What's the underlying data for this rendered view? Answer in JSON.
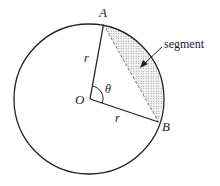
{
  "diagram": {
    "labels": {
      "A": "A",
      "B": "B",
      "O": "O",
      "r1": "r",
      "r2": "r",
      "theta": "θ",
      "segment": "segment"
    },
    "colors": {
      "stroke": "#222222",
      "fill_dots": "#888888",
      "background": "#ffffff"
    }
  }
}
